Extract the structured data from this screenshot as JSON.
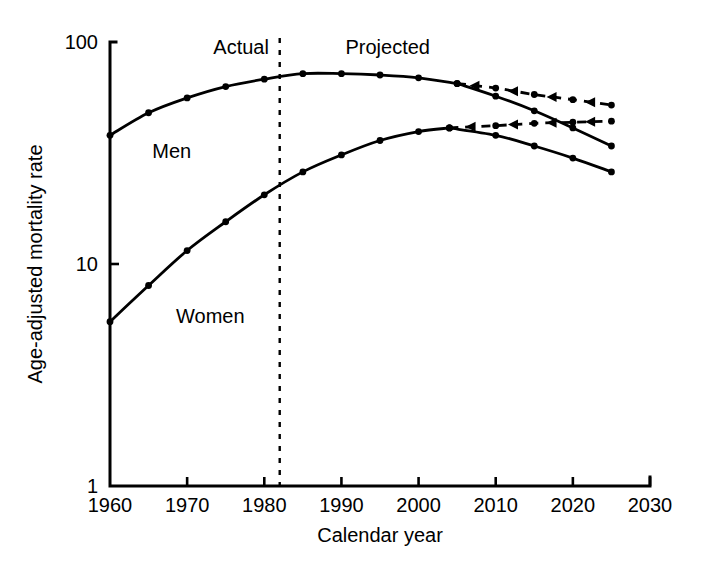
{
  "chart_data": {
    "type": "line",
    "title": "",
    "xlabel": "Calendar year",
    "ylabel": "Age-adjusted mortality rate",
    "xlim": [
      1960,
      2030
    ],
    "ylim": [
      1,
      100
    ],
    "yscale": "log",
    "grid": false,
    "legend": "inline-annotations",
    "xticks": [
      1960,
      1970,
      1980,
      1990,
      2000,
      2010,
      2020,
      2030
    ],
    "xtick_labels": [
      "1960",
      "1970",
      "1980",
      "1990",
      "2000",
      "2010",
      "2020",
      "2030"
    ],
    "yticks": [
      1,
      10,
      100
    ],
    "ytick_labels": [
      "1",
      "10",
      "100"
    ],
    "annotations": [
      {
        "text": "Actual",
        "x": 1977,
        "y": 88
      },
      {
        "text": "Projected",
        "x": 1996,
        "y": 88
      },
      {
        "text": "Men",
        "x": 1968,
        "y": 30
      },
      {
        "text": "Women",
        "x": 1973,
        "y": 5.4
      }
    ],
    "divider": {
      "x": 1982,
      "label_left": "Actual",
      "label_right": "Projected",
      "style": "dashed-vertical"
    },
    "series": [
      {
        "name": "Men",
        "style": "solid",
        "x": [
          1960,
          1965,
          1970,
          1975,
          1980,
          1985,
          1990,
          1995,
          2000,
          2005
        ],
        "values": [
          38,
          48,
          56,
          63,
          68,
          72,
          72,
          71,
          69,
          65
        ]
      },
      {
        "name": "Men projected decline",
        "style": "solid",
        "x": [
          2005,
          2010,
          2015,
          2020,
          2025
        ],
        "values": [
          65,
          57,
          49,
          41,
          34
        ]
      },
      {
        "name": "Men projected plateau",
        "style": "dashed",
        "x": [
          2005,
          2010,
          2015,
          2020,
          2025
        ],
        "values": [
          65,
          62,
          58,
          55,
          52
        ]
      },
      {
        "name": "Women",
        "style": "solid",
        "x": [
          1960,
          1965,
          1970,
          1975,
          1980,
          1985,
          1990,
          1995,
          2000,
          2004
        ],
        "values": [
          5.5,
          8.0,
          11.5,
          15.5,
          20.5,
          26.0,
          31.0,
          36.0,
          39.5,
          41.0
        ]
      },
      {
        "name": "Women projected decline",
        "style": "solid",
        "x": [
          2004,
          2010,
          2015,
          2020,
          2025
        ],
        "values": [
          41.0,
          38.0,
          34.0,
          30.0,
          26.0
        ]
      },
      {
        "name": "Women projected plateau",
        "style": "dashed",
        "x": [
          2004,
          2010,
          2015,
          2020,
          2025
        ],
        "values": [
          41.0,
          42.0,
          43.0,
          43.5,
          44.0
        ]
      }
    ]
  }
}
